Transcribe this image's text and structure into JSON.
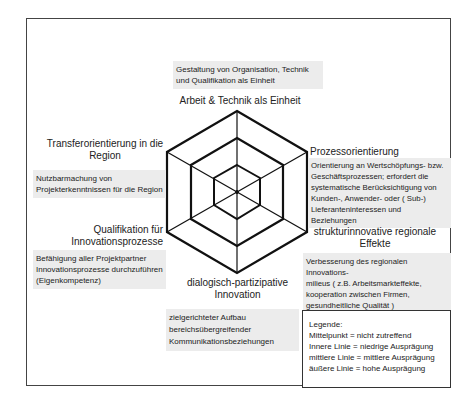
{
  "diagram": {
    "type": "hexagonal-radar-framework",
    "axes": [
      {
        "label": "Arbeit & Technik als Einheit",
        "description": [
          "Gestaltung von Organisation, Technik",
          "und Qualifikation als Einheit"
        ]
      },
      {
        "label": "Prozessorientierung",
        "description": [
          "Orientierung an Wertschöpfungs- bzw.",
          "Geschäftsprozessen; erfordert die",
          "systematische Berücksichtigung von",
          "Kunden-, Anwender- oder ( Sub-)",
          "Lieferanteninteressen und Beziehungen"
        ]
      },
      {
        "label_lines": [
          "strukturinnovative regionale",
          "Effekte"
        ],
        "description": [
          "Verbesserung des regionalen Innovations-",
          "milieus ( z.B. Arbeitsmarkteffekte,",
          "kooperation zwischen Firmen,",
          "gesundheitliche Qualität )"
        ]
      },
      {
        "label_lines": [
          "dialogisch-partizipative",
          "Innovation"
        ],
        "description": [
          "zielgerichteter Aufbau",
          "bereichsübergreifender",
          "Kommunikationsbeziehungen"
        ]
      },
      {
        "label_lines": [
          "Qualifikation für",
          "Innovationsprozesse"
        ],
        "description": [
          "Befähigung aller Projektpartner",
          "Innovationsprozesse durchzuführen",
          "(Eigenkompetenz)"
        ]
      },
      {
        "label_lines": [
          "Transferorientierung in die",
          "Region"
        ],
        "description": [
          "Nutzbarmachung von",
          "Projekterkenntnissen für die Region"
        ]
      }
    ],
    "rings": 3
  },
  "legend": {
    "title": "Legende:",
    "items": [
      "Mittelpunkt = nicht zutreffend",
      "Innere Linie = niedrige Ausprägung",
      "mittlere Linie = mittlere Ausprägung",
      "äußere Linie = hohe Ausprägung"
    ]
  }
}
